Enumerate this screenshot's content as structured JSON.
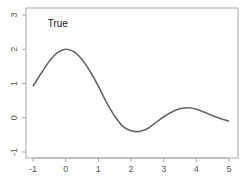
{
  "chart_data": {
    "type": "line",
    "title": "",
    "xlabel": "",
    "ylabel": "",
    "xlim": [
      -1,
      5
    ],
    "ylim": [
      -1,
      3
    ],
    "grid": false,
    "legend": null,
    "annotations": [
      {
        "text": "True",
        "x": -0.55,
        "y": 2.65
      }
    ],
    "x_ticks": [
      -1,
      0,
      1,
      2,
      3,
      4,
      5
    ],
    "x_tick_labels": [
      "-1",
      "0",
      "1",
      "2",
      "3",
      "4",
      "5"
    ],
    "y_ticks": [
      -1,
      0,
      1,
      2,
      3
    ],
    "y_tick_labels": [
      "-1",
      "0",
      "1",
      "2",
      "3"
    ],
    "series": [
      {
        "name": "True",
        "color": "#666666",
        "x": [
          -1.0,
          -0.75,
          -0.5,
          -0.25,
          0.0,
          0.25,
          0.5,
          0.75,
          1.0,
          1.25,
          1.5,
          1.75,
          2.0,
          2.25,
          2.5,
          2.75,
          3.0,
          3.25,
          3.5,
          3.75,
          4.0,
          4.25,
          4.5,
          4.75,
          5.0
        ],
        "values": [
          0.92,
          1.3,
          1.65,
          1.9,
          2.0,
          1.93,
          1.7,
          1.35,
          0.92,
          0.45,
          0.05,
          -0.25,
          -0.38,
          -0.4,
          -0.32,
          -0.15,
          0.03,
          0.17,
          0.26,
          0.29,
          0.25,
          0.16,
          0.06,
          -0.03,
          -0.1
        ]
      }
    ]
  }
}
